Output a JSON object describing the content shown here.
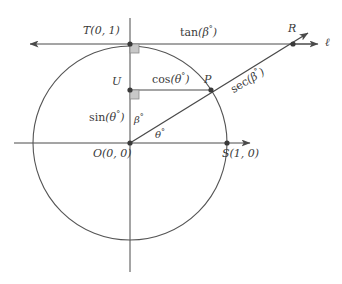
{
  "figure": {
    "labels": {
      "point_t": "T(0, 1)",
      "point_u": "U",
      "point_p": "P",
      "point_r": "R",
      "point_o": "O(0, 0)",
      "point_s": "S(1, 0)",
      "line_l": "ℓ",
      "seg_tan": "tan(β°)",
      "seg_cos": "cos(θ°)",
      "seg_sin": "sin(θ°)",
      "seg_sec": "sec(β°)",
      "angle_beta": "β°",
      "angle_theta": "θ°"
    },
    "colors": {
      "stroke": "#4a4a4a",
      "circle": "#555555",
      "text": "#3a3a3a",
      "right_angle_fill": "#c8c8c8",
      "background": "#ffffff"
    },
    "geometry": {
      "center_x": 130,
      "center_y": 143,
      "radius": 97,
      "point_p_x": 211,
      "point_p_y": 90,
      "point_r_x": 293,
      "point_r_y": 44,
      "point_t_x": 130,
      "point_t_y": 44,
      "point_u_x": 130,
      "point_u_y": 90,
      "point_s_x": 227,
      "point_s_y": 143,
      "theta_degrees": 33
    }
  }
}
